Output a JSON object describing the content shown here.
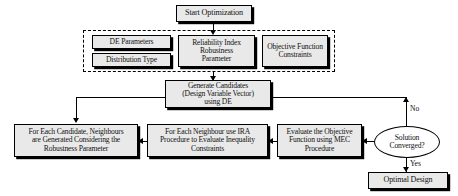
{
  "diagram": {
    "type": "flowchart",
    "colors": {
      "node_fill": "#e9e9e9",
      "node_border": "#000000",
      "ellipse_fill": "#ffffff",
      "shadow": "#000000",
      "background": "#ffffff"
    },
    "nodes": {
      "start": {
        "label": "Start Optimization",
        "shape": "rectangle"
      },
      "de_parameters": {
        "label": "DE Parameters",
        "shape": "rectangle"
      },
      "distribution_type": {
        "label": "Distribution Type",
        "shape": "rectangle"
      },
      "reliability_index": {
        "label": "Reliability Index\nRobustness\nParameter",
        "shape": "rectangle"
      },
      "objective_constraints": {
        "label": "Objective Function\nConstraints",
        "shape": "rectangle"
      },
      "generate_candidates": {
        "label": "Generate Candidates\n(Design Variable Vector)\nusing DE",
        "shape": "rectangle"
      },
      "neighbours": {
        "label": "For Each Candidate, Neighbours\nare Generated Considering the\nRobustness Parameter",
        "shape": "rectangle"
      },
      "ira_procedure": {
        "label": "For Each Neighbour use IRA\nProcedure to Evaluate Inequality\nConstraints",
        "shape": "rectangle"
      },
      "mec_procedure": {
        "label": "Evaluate the Objective\nFunction using MEC\nProcedure",
        "shape": "rectangle"
      },
      "decision": {
        "label": "Solution\nConverged?",
        "shape": "ellipse"
      },
      "optimal_design": {
        "label": "Optimal Design",
        "shape": "rectangle"
      }
    },
    "edge_labels": {
      "no": "No",
      "yes": "Yes"
    }
  }
}
